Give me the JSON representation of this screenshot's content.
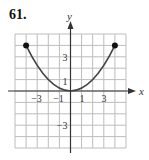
{
  "problem_number": "61.",
  "colors": {
    "grid": "#bdbdbd",
    "axes": "#333333",
    "curve": "#444444",
    "endpoints": "#111111"
  },
  "chart_data": {
    "type": "line",
    "title": "61.",
    "function": "y = x^2/4",
    "xlabel": "x",
    "ylabel": "y",
    "xlim": [
      -5,
      5
    ],
    "ylim": [
      -5,
      5
    ],
    "grid": true,
    "x_tick_labels": [
      "−3",
      "−1",
      "1",
      "3"
    ],
    "x_tick_values": [
      -3,
      -1,
      1,
      3
    ],
    "y_tick_labels": [
      "3",
      "1",
      "−3"
    ],
    "y_tick_values": [
      3,
      1,
      -3
    ],
    "series": [
      {
        "name": "parabola",
        "x": [
          -4,
          -3,
          -2,
          -1,
          0,
          1,
          2,
          3,
          4
        ],
        "y": [
          4,
          2.25,
          1,
          0.25,
          0,
          0.25,
          1,
          2.25,
          4
        ]
      }
    ],
    "endpoints": [
      {
        "x": -4,
        "y": 4,
        "style": "closed"
      },
      {
        "x": 4,
        "y": 4,
        "style": "closed"
      }
    ]
  }
}
